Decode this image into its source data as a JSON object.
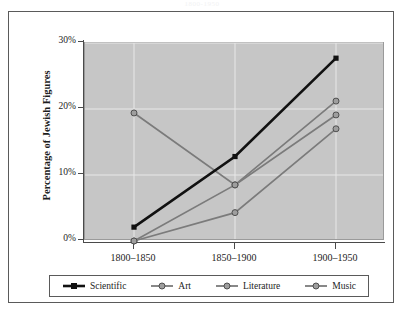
{
  "top_title": "1800-1950",
  "chart_data": {
    "type": "line",
    "title": "",
    "xlabel": "",
    "ylabel": "Percentage of Jewish Figures",
    "categories": [
      "1800–1850",
      "1850–1900",
      "1900–1950"
    ],
    "ylim": [
      0,
      30
    ],
    "yticks": [
      0,
      10,
      20,
      30
    ],
    "ytick_labels": [
      "0%",
      "10%",
      "20%",
      "30%"
    ],
    "grid": true,
    "legend_position": "bottom",
    "series": [
      {
        "name": "Scientific",
        "color": "#111111",
        "marker": "square",
        "line_width": 2.6,
        "values": [
          2.1,
          12.8,
          27.7
        ]
      },
      {
        "name": "Art",
        "color": "#7b7b7b",
        "marker": "circle",
        "line_width": 1.7,
        "values": [
          19.4,
          8.5,
          19.1
        ]
      },
      {
        "name": "Literature",
        "color": "#7b7b7b",
        "marker": "circle",
        "line_width": 1.7,
        "values": [
          0.0,
          8.5,
          21.2
        ]
      },
      {
        "name": "Music",
        "color": "#7b7b7b",
        "marker": "circle",
        "line_width": 1.7,
        "values": [
          0.0,
          4.3,
          17.0
        ]
      }
    ]
  },
  "colors": {
    "plot_background": "#c6c6c6",
    "card_background": "#ffffff",
    "gridline": "#e8e8e8",
    "axis": "#4a4a4a",
    "series_primary": "#111111",
    "series_secondary": "#7b7b7b"
  }
}
